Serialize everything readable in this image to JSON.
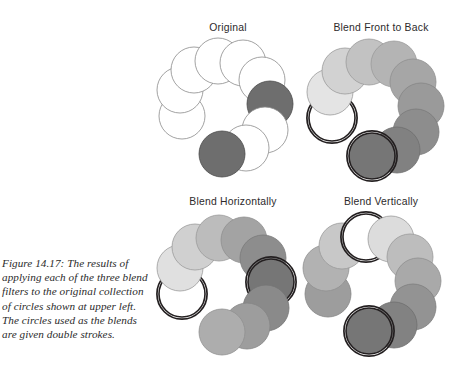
{
  "figure": {
    "caption": "Figure 14.17: The results of applying each of the three blend filters to the original collection of circles shown at upper left. The circles used as the blends are given double strokes.",
    "background_color": "#ffffff",
    "stroke_color": "#58595b",
    "double_stroke_color": "#231f20"
  },
  "panels": [
    {
      "id": "original",
      "title": "Original",
      "circle_radius": 23,
      "circles": [
        {
          "index": 0,
          "cx": 30,
          "cy": 78,
          "fill": "#ffffff",
          "stroke": "#8a8a8a",
          "double": false
        },
        {
          "index": 1,
          "cx": 28,
          "cy": 52,
          "fill": "#ffffff",
          "stroke": "#8a8a8a",
          "double": false
        },
        {
          "index": 2,
          "cx": 42,
          "cy": 32,
          "fill": "#ffffff",
          "stroke": "#8a8a8a",
          "double": false
        },
        {
          "index": 3,
          "cx": 66,
          "cy": 23,
          "fill": "#ffffff",
          "stroke": "#8a8a8a",
          "double": false
        },
        {
          "index": 4,
          "cx": 91,
          "cy": 25,
          "fill": "#ffffff",
          "stroke": "#8a8a8a",
          "double": false
        },
        {
          "index": 5,
          "cx": 110,
          "cy": 42,
          "fill": "#ffffff",
          "stroke": "#8a8a8a",
          "double": false
        },
        {
          "index": 6,
          "cx": 118,
          "cy": 66,
          "fill": "#6e6e6e",
          "stroke": "#4a4a4a",
          "double": false
        },
        {
          "index": 7,
          "cx": 113,
          "cy": 92,
          "fill": "#ffffff",
          "stroke": "#8a8a8a",
          "double": false
        },
        {
          "index": 8,
          "cx": 94,
          "cy": 110,
          "fill": "#ffffff",
          "stroke": "#8a8a8a",
          "double": false
        },
        {
          "index": 9,
          "cx": 70,
          "cy": 116,
          "fill": "#6e6e6e",
          "stroke": "#4a4a4a",
          "double": false
        }
      ]
    },
    {
      "id": "front-to-back",
      "title": "Blend Front to Back",
      "circle_radius": 23,
      "circles": [
        {
          "index": 0,
          "cx": 32,
          "cy": 80,
          "fill": "#ffffff",
          "stroke": "#231f20",
          "double": true
        },
        {
          "index": 1,
          "cx": 30,
          "cy": 54,
          "fill": "#e4e4e4",
          "stroke": "#9a9a9a",
          "double": false
        },
        {
          "index": 2,
          "cx": 45,
          "cy": 33,
          "fill": "#d2d2d2",
          "stroke": "#9a9a9a",
          "double": false
        },
        {
          "index": 3,
          "cx": 69,
          "cy": 24,
          "fill": "#c2c2c2",
          "stroke": "#9a9a9a",
          "double": false
        },
        {
          "index": 4,
          "cx": 94,
          "cy": 26,
          "fill": "#b4b4b4",
          "stroke": "#9a9a9a",
          "double": false
        },
        {
          "index": 5,
          "cx": 113,
          "cy": 44,
          "fill": "#a6a6a6",
          "stroke": "#8f8f8f",
          "double": false
        },
        {
          "index": 6,
          "cx": 121,
          "cy": 68,
          "fill": "#9a9a9a",
          "stroke": "#858585",
          "double": false
        },
        {
          "index": 7,
          "cx": 116,
          "cy": 94,
          "fill": "#8d8d8d",
          "stroke": "#7a7a7a",
          "double": false
        },
        {
          "index": 8,
          "cx": 97,
          "cy": 112,
          "fill": "#818181",
          "stroke": "#6e6e6e",
          "double": false
        },
        {
          "index": 9,
          "cx": 72,
          "cy": 118,
          "fill": "#767676",
          "stroke": "#231f20",
          "double": true
        }
      ]
    },
    {
      "id": "horizontal",
      "title": "Blend Horizontally",
      "circle_radius": 23,
      "circles": [
        {
          "index": 0,
          "cx": 30,
          "cy": 82,
          "fill": "#ffffff",
          "stroke": "#231f20",
          "double": true
        },
        {
          "index": 1,
          "cx": 28,
          "cy": 56,
          "fill": "#e0e0e0",
          "stroke": "#9a9a9a",
          "double": false
        },
        {
          "index": 2,
          "cx": 43,
          "cy": 35,
          "fill": "#d0d0d0",
          "stroke": "#9a9a9a",
          "double": false
        },
        {
          "index": 3,
          "cx": 67,
          "cy": 26,
          "fill": "#bcbcbc",
          "stroke": "#9a9a9a",
          "double": false
        },
        {
          "index": 4,
          "cx": 92,
          "cy": 28,
          "fill": "#a3a3a3",
          "stroke": "#8f8f8f",
          "double": false
        },
        {
          "index": 5,
          "cx": 111,
          "cy": 46,
          "fill": "#8d8d8d",
          "stroke": "#7a7a7a",
          "double": false
        },
        {
          "index": 6,
          "cx": 119,
          "cy": 70,
          "fill": "#767676",
          "stroke": "#231f20",
          "double": true
        },
        {
          "index": 7,
          "cx": 114,
          "cy": 96,
          "fill": "#8a8a8a",
          "stroke": "#757575",
          "double": false
        },
        {
          "index": 8,
          "cx": 95,
          "cy": 114,
          "fill": "#9d9d9d",
          "stroke": "#858585",
          "double": false
        },
        {
          "index": 9,
          "cx": 70,
          "cy": 120,
          "fill": "#adadad",
          "stroke": "#909090",
          "double": false
        }
      ]
    },
    {
      "id": "vertical",
      "title": "Blend Vertically",
      "circle_radius": 23,
      "circles": [
        {
          "index": 0,
          "cx": 28,
          "cy": 82,
          "fill": "#9d9d9d",
          "stroke": "#858585",
          "double": false
        },
        {
          "index": 1,
          "cx": 26,
          "cy": 56,
          "fill": "#b2b2b2",
          "stroke": "#909090",
          "double": false
        },
        {
          "index": 2,
          "cx": 42,
          "cy": 34,
          "fill": "#c8c8c8",
          "stroke": "#9a9a9a",
          "double": false
        },
        {
          "index": 3,
          "cx": 66,
          "cy": 25,
          "fill": "#ffffff",
          "stroke": "#231f20",
          "double": true
        },
        {
          "index": 4,
          "cx": 91,
          "cy": 27,
          "fill": "#dcdcdc",
          "stroke": "#9a9a9a",
          "double": false
        },
        {
          "index": 5,
          "cx": 110,
          "cy": 45,
          "fill": "#bdbdbd",
          "stroke": "#9a9a9a",
          "double": false
        },
        {
          "index": 6,
          "cx": 118,
          "cy": 69,
          "fill": "#a9a9a9",
          "stroke": "#8f8f8f",
          "double": false
        },
        {
          "index": 7,
          "cx": 113,
          "cy": 95,
          "fill": "#939393",
          "stroke": "#7d7d7d",
          "double": false
        },
        {
          "index": 8,
          "cx": 94,
          "cy": 113,
          "fill": "#828282",
          "stroke": "#6e6e6e",
          "double": false
        },
        {
          "index": 9,
          "cx": 69,
          "cy": 119,
          "fill": "#767676",
          "stroke": "#231f20",
          "double": true
        }
      ]
    }
  ]
}
